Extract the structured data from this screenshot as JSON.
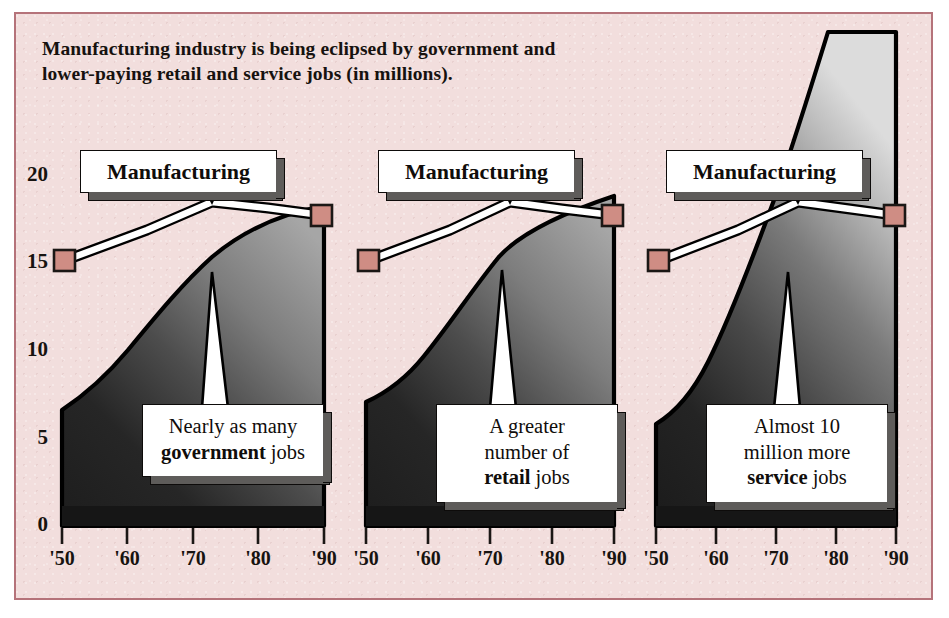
{
  "figure": {
    "background_color": "#f2dedd",
    "border_color": "#b5737a",
    "title_lines": [
      "Manufacturing industry is being eclipsed by government and",
      "lower-paying retail and service jobs (in millions)."
    ]
  },
  "axes": {
    "y_ticks": [
      "20",
      "15",
      "10",
      "5",
      "0"
    ],
    "x_ticks": [
      "'50",
      "'60",
      "'70",
      "'80",
      "'90"
    ]
  },
  "panels": [
    {
      "id": "government",
      "series_label": "Manufacturing",
      "note_html": "Nearly as many <b>government</b> jobs",
      "note_plain": "Nearly as many government jobs"
    },
    {
      "id": "retail",
      "series_label": "Manufacturing",
      "note_html": "A greater<br>number of<br><b>retail</b> jobs",
      "note_plain": "A greater number of retail jobs"
    },
    {
      "id": "service",
      "series_label": "Manufacturing",
      "note_html": "Almost 10<br>million more<br><b>service</b> jobs",
      "note_plain": "Almost 10 million more service jobs"
    }
  ],
  "chart_data": {
    "type": "area",
    "title": "Manufacturing industry is being eclipsed by government and lower-paying retail and service jobs (in millions)",
    "xlabel": "",
    "ylabel": "jobs (in millions)",
    "x": [
      1950,
      1960,
      1970,
      1980,
      1990
    ],
    "tick_labels": [
      "'50",
      "'60",
      "'70",
      "'80",
      "'90"
    ],
    "ylim": [
      0,
      20
    ],
    "y_ticks": [
      0,
      5,
      10,
      15,
      20
    ],
    "grid": false,
    "legend": "none",
    "panels": [
      {
        "name": "government",
        "area_series": {
          "name": "Government",
          "values": [
            6.0,
            8.6,
            12.6,
            16.2,
            17.6
          ]
        },
        "line_series": {
          "name": "Manufacturing",
          "values": [
            15.2,
            16.8,
            18.3,
            17.9,
            17.5
          ],
          "markers_at": [
            1950,
            1990
          ],
          "marker_color": "#cf8d84"
        },
        "annotation": "Nearly as many government jobs"
      },
      {
        "name": "retail",
        "area_series": {
          "name": "Retail",
          "values": [
            6.6,
            8.4,
            11.6,
            15.4,
            18.4
          ]
        },
        "line_series": {
          "name": "Manufacturing",
          "values": [
            15.2,
            16.8,
            18.3,
            17.9,
            17.5
          ],
          "markers_at": [
            1950,
            1990
          ],
          "marker_color": "#cf8d84"
        },
        "annotation": "A greater number of retail jobs"
      },
      {
        "name": "service",
        "area_series": {
          "name": "Service",
          "values": [
            5.4,
            7.6,
            11.8,
            18.0,
            27.2
          ]
        },
        "line_series": {
          "name": "Manufacturing",
          "values": [
            15.2,
            16.8,
            18.3,
            17.9,
            17.5
          ],
          "markers_at": [
            1950,
            1990
          ],
          "marker_color": "#cf8d84"
        },
        "annotation": "Almost 10 million more service jobs"
      }
    ]
  }
}
